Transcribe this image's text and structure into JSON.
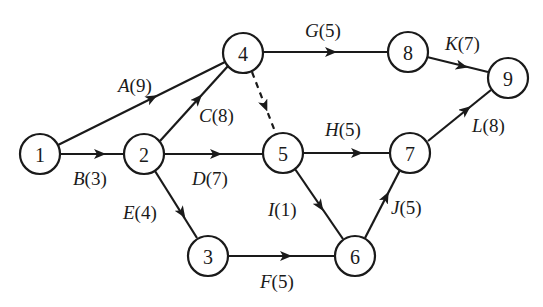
{
  "diagram": {
    "type": "activity-on-arrow network",
    "nodes": [
      {
        "id": "1",
        "label": "1",
        "x": 40,
        "y": 154
      },
      {
        "id": "2",
        "label": "2",
        "x": 144,
        "y": 154
      },
      {
        "id": "3",
        "label": "3",
        "x": 208,
        "y": 255
      },
      {
        "id": "4",
        "label": "4",
        "x": 243,
        "y": 53
      },
      {
        "id": "5",
        "label": "5",
        "x": 283,
        "y": 153
      },
      {
        "id": "6",
        "label": "6",
        "x": 355,
        "y": 255
      },
      {
        "id": "7",
        "label": "7",
        "x": 410,
        "y": 153
      },
      {
        "id": "8",
        "label": "8",
        "x": 408,
        "y": 52
      },
      {
        "id": "9",
        "label": "9",
        "x": 508,
        "y": 78
      }
    ],
    "edges": [
      {
        "from": "1",
        "to": "4",
        "activity": "A",
        "duration": "(9)",
        "dummy": false
      },
      {
        "from": "1",
        "to": "2",
        "activity": "B",
        "duration": "(3)",
        "dummy": false
      },
      {
        "from": "2",
        "to": "4",
        "activity": "C",
        "duration": "(8)",
        "dummy": false
      },
      {
        "from": "2",
        "to": "5",
        "activity": "D",
        "duration": "(7)",
        "dummy": false
      },
      {
        "from": "2",
        "to": "3",
        "activity": "E",
        "duration": "(4)",
        "dummy": false
      },
      {
        "from": "3",
        "to": "6",
        "activity": "F",
        "duration": "(5)",
        "dummy": false
      },
      {
        "from": "4",
        "to": "8",
        "activity": "G",
        "duration": "(5)",
        "dummy": false
      },
      {
        "from": "5",
        "to": "7",
        "activity": "H",
        "duration": "(5)",
        "dummy": false
      },
      {
        "from": "5",
        "to": "6",
        "activity": "I",
        "duration": "(1)",
        "dummy": false
      },
      {
        "from": "6",
        "to": "7",
        "activity": "J",
        "duration": "(5)",
        "dummy": false
      },
      {
        "from": "8",
        "to": "9",
        "activity": "K",
        "duration": "(7)",
        "dummy": false
      },
      {
        "from": "7",
        "to": "9",
        "activity": "L",
        "duration": "(8)",
        "dummy": false
      },
      {
        "from": "4",
        "to": "5",
        "activity": "",
        "duration": "",
        "dummy": true
      }
    ],
    "labels": {
      "A": {
        "text": "A",
        "dur": "(9)"
      },
      "B": {
        "text": "B",
        "dur": "(3)"
      },
      "C": {
        "text": "C",
        "dur": "(8)"
      },
      "D": {
        "text": "D",
        "dur": "(7)"
      },
      "E": {
        "text": "E",
        "dur": "(4)"
      },
      "F": {
        "text": "F",
        "dur": "(5)"
      },
      "G": {
        "text": "G",
        "dur": "(5)"
      },
      "H": {
        "text": "H",
        "dur": "(5)"
      },
      "I": {
        "text": "I",
        "dur": "(1)"
      },
      "J": {
        "text": "J",
        "dur": "(5)"
      },
      "K": {
        "text": "K",
        "dur": "(7)"
      },
      "L": {
        "text": "L",
        "dur": "(8)"
      }
    },
    "node_labels": {
      "n1": "1",
      "n2": "2",
      "n3": "3",
      "n4": "4",
      "n5": "5",
      "n6": "6",
      "n7": "7",
      "n8": "8",
      "n9": "9"
    },
    "colors": {
      "stroke": "#1a1a1a",
      "background": "#ffffff"
    }
  }
}
